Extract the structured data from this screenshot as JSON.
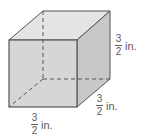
{
  "figure": {
    "shape": "cube",
    "colors": {
      "front_face": "#d6d6d6",
      "top_face": "#e4e4e4",
      "right_face": "#c8c8c8",
      "edge": "#555555",
      "hidden_edge": "#555555"
    },
    "labels": {
      "height": {
        "numerator": "3",
        "denominator": "2",
        "unit": "in."
      },
      "depth": {
        "numerator": "3",
        "denominator": "2",
        "unit": "in."
      },
      "width": {
        "numerator": "3",
        "denominator": "2",
        "unit": "in."
      }
    }
  }
}
